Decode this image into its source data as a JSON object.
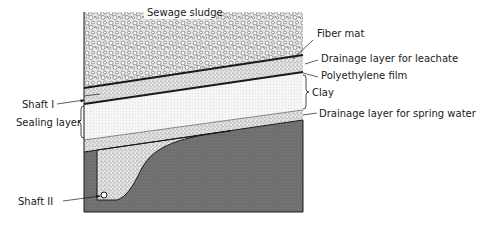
{
  "diagram": {
    "layers": {
      "sludge": "Sewage sludge",
      "fiber_mat": "Fiber mat",
      "drainage_leachate": "Drainage layer for leachate",
      "film": "Polyethylene film",
      "clay": "Clay",
      "drainage_spring": "Drainage layer for spring water"
    },
    "left_labels": {
      "shaft1": "Shaft I",
      "sealing": "Sealing layer",
      "shaft2": "Shaft II"
    },
    "colors": {
      "line": "#1a1a1a",
      "dark_fill": "#6e6e6e",
      "stipple_bg": "#e6e6e6",
      "clay_bg": "#f4f4f4"
    }
  }
}
